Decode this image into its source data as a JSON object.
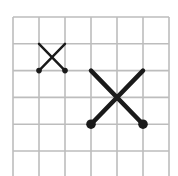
{
  "diagram": {
    "type": "grid-with-crosses",
    "grid": {
      "columns": 6,
      "rows": 6,
      "origin_x": 13,
      "origin_y": 17,
      "cell_w": 26,
      "cell_h": 26.8,
      "line_color": "#bdbdbd",
      "line_width": 1.6
    },
    "shapes": [
      {
        "name": "small-cross",
        "from_cell": [
          1,
          1
        ],
        "to_cell": [
          2,
          2
        ],
        "stroke_color": "#1a1a1a",
        "stroke_width": 2.4,
        "dot_radius": 2.8,
        "dots_at": [
          "bottom-left",
          "bottom-right"
        ]
      },
      {
        "name": "large-cross",
        "from_cell": [
          3,
          2
        ],
        "to_cell": [
          5,
          4
        ],
        "stroke_color": "#1a1a1a",
        "stroke_width": 4.5,
        "dot_radius": 4.8,
        "dots_at": [
          "bottom-left",
          "bottom-right"
        ]
      }
    ]
  }
}
